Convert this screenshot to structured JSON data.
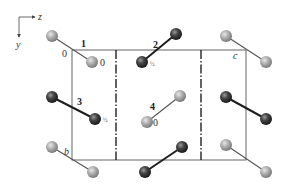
{
  "figure": {
    "axes": {
      "horizontal_label": "z",
      "vertical_label": "y"
    },
    "cell_labels": {
      "origin": "0",
      "b": "b",
      "c": "c"
    },
    "colors": {
      "light_atom": "#a9a9a9",
      "dark_atom": "#3a3a3a",
      "cell_line": "#555555",
      "symmetry_line": "#222222"
    },
    "molecules": [
      {
        "id": "1",
        "label": "1",
        "height": "0",
        "shade": "light",
        "a": [
          52,
          36
        ],
        "b": [
          92,
          62
        ]
      },
      {
        "id": "2",
        "label": "2",
        "height": "½",
        "shade": "dark",
        "a": [
          176,
          34
        ],
        "b": [
          142,
          62
        ]
      },
      {
        "id": "3",
        "label": "3",
        "height": "½",
        "shade": "dark",
        "a": [
          52,
          97
        ],
        "b": [
          95,
          119
        ]
      },
      {
        "id": "4",
        "label": "4",
        "height": "0",
        "shade": "light",
        "a": [
          180,
          96
        ],
        "b": [
          147,
          122
        ]
      },
      {
        "id": "5",
        "label": "",
        "height": "",
        "shade": "light",
        "a": [
          226,
          36
        ],
        "b": [
          266,
          62
        ]
      },
      {
        "id": "6",
        "label": "",
        "height": "",
        "shade": "dark",
        "a": [
          226,
          97
        ],
        "b": [
          266,
          119
        ]
      },
      {
        "id": "7",
        "label": "",
        "height": "",
        "shade": "light",
        "a": [
          52,
          147
        ],
        "b": [
          93,
          172
        ]
      },
      {
        "id": "8",
        "label": "",
        "height": "",
        "shade": "dark",
        "a": [
          182,
          147
        ],
        "b": [
          145,
          172
        ]
      },
      {
        "id": "9",
        "label": "",
        "height": "",
        "shade": "light",
        "a": [
          226,
          145
        ],
        "b": [
          266,
          172
        ]
      }
    ],
    "extra_atoms": [
      {
        "shade": "dark",
        "x": 142,
        "y": 62
      }
    ]
  }
}
